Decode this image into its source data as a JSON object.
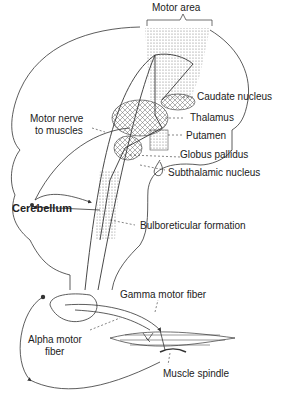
{
  "diagram": {
    "labels": {
      "motor_area": "Motor area",
      "caudate_nucleus": "Caudate nucleus",
      "motor_nerve_1": "Motor nerve",
      "motor_nerve_2": "to muscles",
      "thalamus": "Thalamus",
      "putamen": "Putamen",
      "globus_pallidus": "Globus pallidus",
      "subthalamic_nucleus": "Subthalamic nucleus",
      "cerebellum": "Cerebellum",
      "bulboreticular_formation": "Bulboreticular formation",
      "gamma_motor_fiber": "Gamma motor fiber",
      "alpha_motor_1": "Alpha motor",
      "alpha_motor_2": "fiber",
      "muscle_spindle": "Muscle spindle"
    },
    "colors": {
      "line": "#333333",
      "stipple": "#9a9a9a",
      "background": "#ffffff"
    }
  }
}
